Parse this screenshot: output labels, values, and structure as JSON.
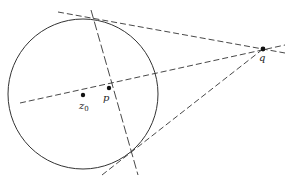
{
  "diagram": {
    "type": "geometry",
    "colors": {
      "stroke": "#333333",
      "background": "#ffffff"
    },
    "circle": {
      "cx": 83,
      "cy": 94,
      "r": 75
    },
    "points": {
      "z0": {
        "x": 83,
        "y": 95,
        "label": "z",
        "subscript": "0"
      },
      "p": {
        "x": 109,
        "y": 88,
        "label": "p"
      },
      "q": {
        "x": 263,
        "y": 49,
        "label": "q"
      }
    },
    "lines": {
      "tangent_top": {
        "x1": 58,
        "y1": 12,
        "x2": 285,
        "y2": 53
      },
      "tangent_bottom": {
        "x1": 102,
        "y1": 175,
        "x2": 263,
        "y2": 49
      },
      "center_line": {
        "x1": 20,
        "y1": 103,
        "x2": 285,
        "y2": 45
      },
      "polar": {
        "x1": 91,
        "y1": 10,
        "x2": 138,
        "y2": 175
      }
    }
  }
}
